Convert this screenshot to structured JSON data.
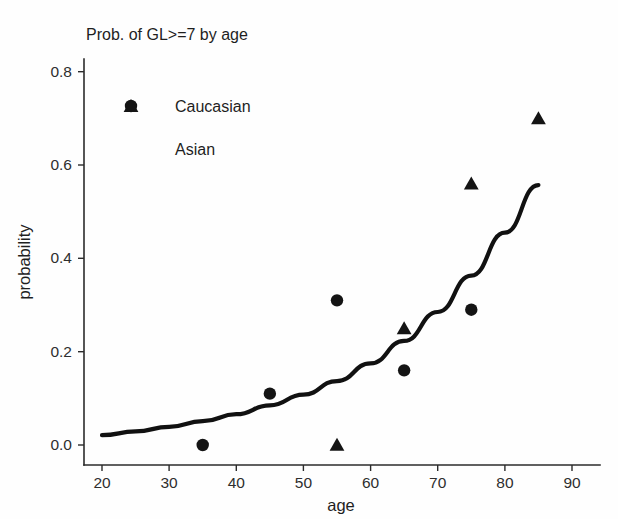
{
  "chart_data": {
    "type": "scatter",
    "title": "Prob. of GL>=7  by age",
    "xlabel": "age",
    "ylabel": "probability",
    "xlim": [
      18,
      93
    ],
    "ylim": [
      -0.03,
      0.85
    ],
    "xticks": [
      20,
      30,
      40,
      50,
      60,
      70,
      80,
      90
    ],
    "xtick_labels": [
      "20",
      "30",
      "40",
      "50",
      "60",
      "70",
      "80",
      "90"
    ],
    "yticks": [
      0.0,
      0.2,
      0.4,
      0.6,
      0.8
    ],
    "ytick_labels": [
      "0.0",
      "0.2",
      "0.4",
      "0.6",
      "0.8"
    ],
    "grid": false,
    "legend_position": "upper-left-inside",
    "series": [
      {
        "name": "Caucasian",
        "marker": "circle",
        "color": "#141414",
        "x": [
          35,
          45,
          55,
          65,
          75
        ],
        "y": [
          0.0,
          0.11,
          0.31,
          0.16,
          0.29
        ]
      },
      {
        "name": "Asian",
        "marker": "triangle",
        "color": "#141414",
        "x": [
          55,
          65,
          75,
          85
        ],
        "y": [
          0.0,
          0.25,
          0.56,
          0.7
        ]
      },
      {
        "name": "fitted curve",
        "marker": "line",
        "color": "#111111",
        "x": [
          20,
          25,
          30,
          35,
          40,
          45,
          50,
          55,
          60,
          65,
          70,
          75,
          80,
          85
        ],
        "y": [
          0.021,
          0.029,
          0.039,
          0.051,
          0.066,
          0.085,
          0.108,
          0.137,
          0.175,
          0.223,
          0.285,
          0.363,
          0.455,
          0.557
        ]
      }
    ]
  },
  "legend": {
    "entries": [
      {
        "label": "Caucasian",
        "marker": "circle"
      },
      {
        "label": "Asian",
        "marker": "triangle"
      }
    ]
  }
}
